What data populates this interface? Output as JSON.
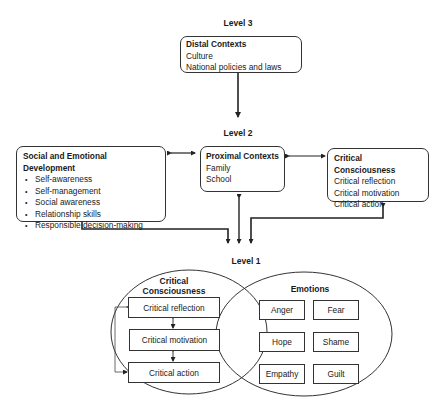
{
  "levels": {
    "level3": "Level 3",
    "level2": "Level 2",
    "level1": "Level 1"
  },
  "distal": {
    "title": "Distal Contexts",
    "items": [
      "Culture",
      "National policies and laws"
    ]
  },
  "sed": {
    "title": "Social and Emotional Development",
    "items": [
      "Self-awareness",
      "Self-management",
      "Social awareness",
      "Relationship skills",
      "Responsible decision-making"
    ]
  },
  "proximal": {
    "title": "Proximal Contexts",
    "items": [
      "Family",
      "School"
    ]
  },
  "critical_consciousness_l2": {
    "title": "Critical Consciousness",
    "items": [
      "Critical reflection",
      "Critical motivation",
      "Critical action"
    ]
  },
  "level1_cc": {
    "title_line1": "Critical",
    "title_line2": "Consciousness",
    "items": [
      "Critical reflection",
      "Critical motivation",
      "Critical action"
    ]
  },
  "emotions": {
    "title": "Emotions",
    "items": [
      "Anger",
      "Fear",
      "Hope",
      "Shame",
      "Empathy",
      "Guilt"
    ]
  }
}
